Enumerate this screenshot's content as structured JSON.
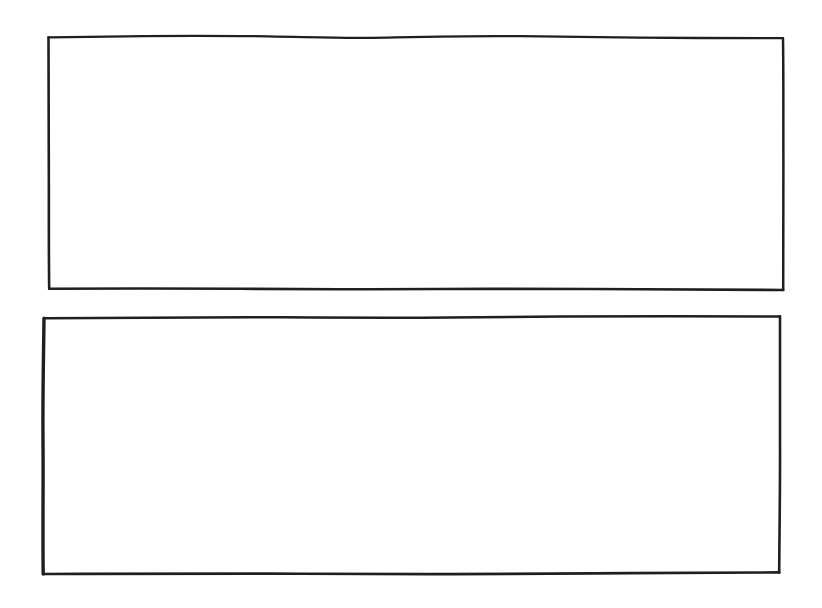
{
  "document": {
    "title": "Hand-drawn Wireframe Sketch",
    "medium": "pen on paper",
    "background_color": "#ffffff",
    "ink_color": "#1a1a1a",
    "canvas": {
      "width": 822,
      "height": 608
    }
  },
  "shapes": [
    {
      "id": "panel-1",
      "kind": "rectangle",
      "label": "",
      "content": "",
      "empty": true,
      "stroke_color": "#1f1f1f",
      "stroke_width": 2.4,
      "fill": "none",
      "bounds": {
        "x": 48,
        "y": 36,
        "width": 735,
        "height": 254
      },
      "corners": {
        "top_left": [
          48,
          37
        ],
        "top_right": [
          783,
          38
        ],
        "bottom_right": [
          783,
          290
        ],
        "bottom_left": [
          49,
          288
        ]
      }
    },
    {
      "id": "panel-2",
      "kind": "rectangle",
      "label": "",
      "content": "",
      "empty": true,
      "stroke_color": "#1f1f1f",
      "stroke_width": 2.8,
      "fill": "none",
      "bounds": {
        "x": 43,
        "y": 316,
        "width": 737,
        "height": 257
      },
      "corners": {
        "top_left": [
          44,
          318
        ],
        "top_right": [
          780,
          316
        ],
        "bottom_right": [
          779,
          572
        ],
        "bottom_left": [
          43,
          574
        ]
      }
    }
  ],
  "annotations": {
    "panel_1_caption": "",
    "panel_2_caption": ""
  }
}
